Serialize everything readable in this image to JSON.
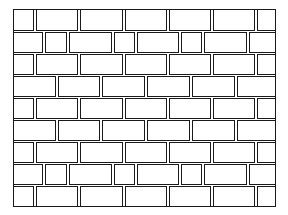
{
  "image": {
    "subject": "brick wall line drawing",
    "width": 288,
    "height": 215,
    "colors": {
      "background": "#ffffff",
      "line": "#1a1a1a",
      "brick_fill": "#ffffff"
    }
  },
  "wall": {
    "left": 13,
    "top": 9,
    "right": 276,
    "bottom": 207,
    "row_height": 22,
    "rows": [
      {
        "pattern": "A",
        "bricks": [
          [
            13,
            34
          ],
          [
            35,
            78
          ],
          [
            79,
            123
          ],
          [
            124,
            167
          ],
          [
            168,
            211
          ],
          [
            212,
            255
          ],
          [
            256,
            276
          ]
        ]
      },
      {
        "pattern": "C",
        "bricks": [
          [
            13,
            43
          ],
          [
            44,
            67
          ],
          [
            68,
            112
          ],
          [
            113,
            135
          ],
          [
            136,
            179
          ],
          [
            180,
            202
          ],
          [
            203,
            247
          ],
          [
            248,
            276
          ]
        ]
      },
      {
        "pattern": "A",
        "bricks": [
          [
            13,
            34
          ],
          [
            35,
            78
          ],
          [
            79,
            123
          ],
          [
            124,
            167
          ],
          [
            168,
            211
          ],
          [
            212,
            255
          ],
          [
            256,
            276
          ]
        ]
      },
      {
        "pattern": "B",
        "bricks": [
          [
            13,
            56
          ],
          [
            57,
            100
          ],
          [
            101,
            145
          ],
          [
            146,
            190
          ],
          [
            191,
            235
          ],
          [
            236,
            276
          ]
        ]
      },
      {
        "pattern": "A",
        "bricks": [
          [
            13,
            34
          ],
          [
            35,
            78
          ],
          [
            79,
            123
          ],
          [
            124,
            167
          ],
          [
            168,
            211
          ],
          [
            212,
            255
          ],
          [
            256,
            276
          ]
        ]
      },
      {
        "pattern": "B",
        "bricks": [
          [
            13,
            56
          ],
          [
            57,
            100
          ],
          [
            101,
            145
          ],
          [
            146,
            190
          ],
          [
            191,
            235
          ],
          [
            236,
            276
          ]
        ]
      },
      {
        "pattern": "A",
        "bricks": [
          [
            13,
            34
          ],
          [
            35,
            78
          ],
          [
            79,
            123
          ],
          [
            124,
            167
          ],
          [
            168,
            211
          ],
          [
            212,
            255
          ],
          [
            256,
            276
          ]
        ]
      },
      {
        "pattern": "C",
        "bricks": [
          [
            13,
            43
          ],
          [
            44,
            67
          ],
          [
            68,
            112
          ],
          [
            113,
            135
          ],
          [
            136,
            179
          ],
          [
            180,
            202
          ],
          [
            203,
            247
          ],
          [
            248,
            276
          ]
        ]
      },
      {
        "pattern": "A",
        "bricks": [
          [
            13,
            34
          ],
          [
            35,
            78
          ],
          [
            79,
            123
          ],
          [
            124,
            167
          ],
          [
            168,
            211
          ],
          [
            212,
            255
          ],
          [
            256,
            276
          ]
        ]
      }
    ]
  }
}
